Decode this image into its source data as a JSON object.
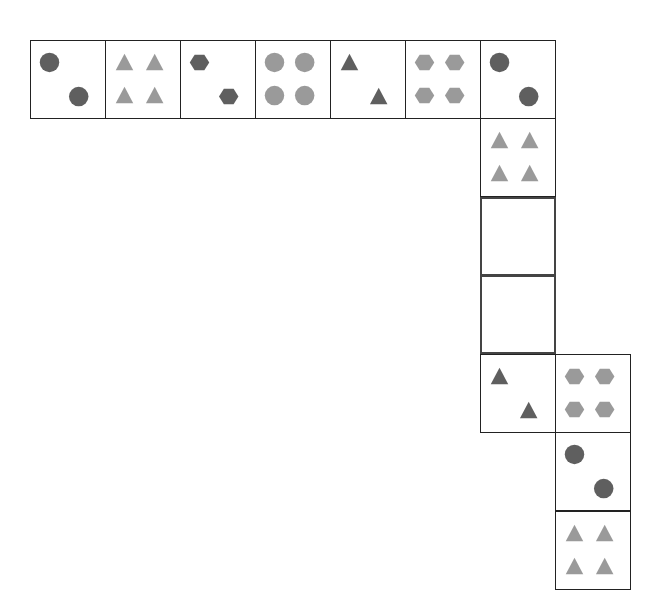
{
  "colors": {
    "dark": "#5f5f5f",
    "light": "#9a9a9a",
    "border": "#222222"
  },
  "cells": [
    {
      "id": "c1",
      "x": 30,
      "y": 40,
      "shape": "circle",
      "count": 2,
      "tone": "dark"
    },
    {
      "id": "c2",
      "x": 105,
      "y": 40,
      "shape": "triangle",
      "count": 4,
      "tone": "light"
    },
    {
      "id": "c3",
      "x": 180,
      "y": 40,
      "shape": "hexagon",
      "count": 2,
      "tone": "dark"
    },
    {
      "id": "c4",
      "x": 255,
      "y": 40,
      "shape": "circle",
      "count": 4,
      "tone": "light"
    },
    {
      "id": "c5",
      "x": 330,
      "y": 40,
      "shape": "triangle",
      "count": 2,
      "tone": "dark"
    },
    {
      "id": "c6",
      "x": 405,
      "y": 40,
      "shape": "hexagon",
      "count": 4,
      "tone": "light"
    },
    {
      "id": "c7",
      "x": 480,
      "y": 40,
      "shape": "circle",
      "count": 2,
      "tone": "dark"
    },
    {
      "id": "c8",
      "x": 480,
      "y": 118,
      "shape": "triangle",
      "count": 4,
      "tone": "light"
    },
    {
      "id": "c9",
      "x": 480,
      "y": 197,
      "shape": "blank",
      "count": 0,
      "tone": ""
    },
    {
      "id": "c10",
      "x": 480,
      "y": 275,
      "shape": "blank",
      "count": 0,
      "tone": ""
    },
    {
      "id": "c11",
      "x": 480,
      "y": 354,
      "shape": "triangle",
      "count": 2,
      "tone": "dark"
    },
    {
      "id": "c12",
      "x": 555,
      "y": 354,
      "shape": "hexagon",
      "count": 4,
      "tone": "light"
    },
    {
      "id": "c13",
      "x": 555,
      "y": 432,
      "shape": "circle",
      "count": 2,
      "tone": "dark"
    },
    {
      "id": "c14",
      "x": 555,
      "y": 511,
      "shape": "triangle",
      "count": 4,
      "tone": "light"
    }
  ],
  "cell_size": {
    "w": 76,
    "h": 79
  },
  "missing_cells": 2
}
